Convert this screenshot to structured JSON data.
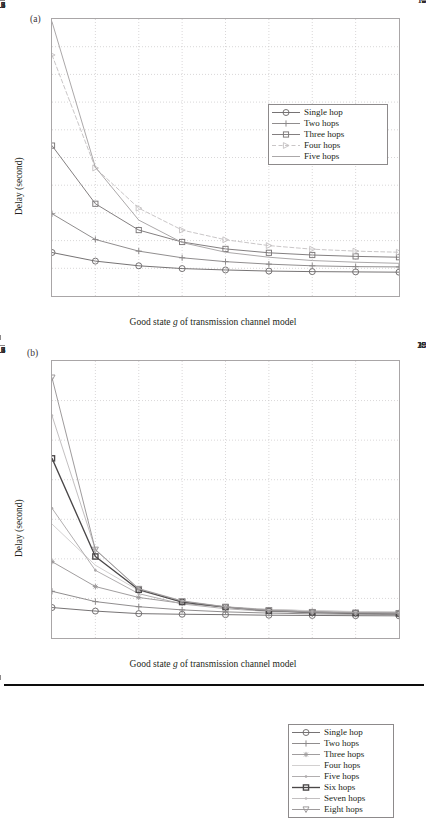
{
  "figure": {
    "panels": [
      {
        "id": "a",
        "label": "(a)",
        "xlabel_prefix": "Good state ",
        "xlabel_italic": "g",
        "xlabel_suffix": " of transmission channel model",
        "ylabel": "Delay (second)"
      },
      {
        "id": "b",
        "label": "(b)",
        "xlabel_prefix": "Good state ",
        "xlabel_italic": "g",
        "xlabel_suffix": " of transmission channel model",
        "ylabel": "Delay (second)"
      }
    ]
  },
  "chart_data": [
    {
      "type": "line",
      "panel": "a",
      "title": "",
      "xlabel": "Good state g of transmission channel model",
      "ylabel": "Delay (second)",
      "x": [
        0.1,
        0.2,
        0.3,
        0.4,
        0.5,
        0.6,
        0.7,
        0.8,
        0.9
      ],
      "xlim": [
        0.1,
        0.9
      ],
      "ylim": [
        1,
        11
      ],
      "xticks": [
        "0.1",
        "0.2",
        "0.3",
        "0.4",
        "0.5",
        "0.6",
        "0.7",
        "0.8",
        "0.9"
      ],
      "yticks": [
        "1",
        "2",
        "3",
        "4",
        "5",
        "6",
        "7",
        "8",
        "9",
        "10",
        "11"
      ],
      "grid": true,
      "legend_position": "upper right",
      "series": [
        {
          "name": "Single hop",
          "marker": "circle",
          "linestyle": "solid",
          "color": "#6f6c6d",
          "values": [
            2.57,
            2.26,
            2.09,
            1.99,
            1.94,
            1.9,
            1.88,
            1.87,
            1.86
          ]
        },
        {
          "name": "Two hops",
          "marker": "plus",
          "linestyle": "solid",
          "color": "#8a8788",
          "values": [
            3.97,
            3.04,
            2.62,
            2.38,
            2.24,
            2.15,
            2.09,
            2.06,
            2.05
          ]
        },
        {
          "name": "Three hops",
          "marker": "square",
          "linestyle": "solid",
          "color": "#7c7879",
          "values": [
            6.43,
            4.33,
            3.38,
            2.95,
            2.7,
            2.56,
            2.48,
            2.43,
            2.4
          ]
        },
        {
          "name": "Four hops",
          "marker": "triangle-right",
          "linestyle": "dashed",
          "color": "#c6c3c4",
          "values": [
            9.7,
            5.62,
            4.17,
            3.38,
            3.03,
            2.82,
            2.69,
            2.62,
            2.58
          ]
        },
        {
          "name": "Five hops",
          "marker": "none",
          "linestyle": "solid",
          "color": "#a6a3a4",
          "values": [
            10.9,
            5.65,
            3.74,
            2.93,
            2.58,
            2.4,
            2.28,
            2.22,
            2.18
          ]
        }
      ]
    },
    {
      "type": "line",
      "panel": "b",
      "title": "",
      "xlabel": "Good state g of transmission channel model",
      "ylabel": "Delay (second)",
      "x": [
        0.1,
        0.2,
        0.3,
        0.4,
        0.5,
        0.6,
        0.7,
        0.8,
        0.9
      ],
      "xlim": [
        0.1,
        0.9
      ],
      "ylim": [
        0,
        35
      ],
      "xticks": [
        "0.1",
        "0.2",
        "0.3",
        "0.4",
        "0.5",
        "0.6",
        "0.7",
        "0.8",
        "0.9"
      ],
      "yticks": [
        "0",
        "5",
        "10",
        "15",
        "20",
        "25",
        "30",
        "35"
      ],
      "grid": true,
      "legend_position": "upper right",
      "series": [
        {
          "name": "Single hop",
          "marker": "circle",
          "linestyle": "solid",
          "color": "#6f6c6d",
          "values": [
            3.85,
            3.4,
            3.08,
            3.0,
            2.95,
            2.88,
            2.85,
            2.82,
            2.8
          ]
        },
        {
          "name": "Two hops",
          "marker": "plus",
          "linestyle": "solid",
          "color": "#8a8788",
          "values": [
            5.9,
            4.6,
            3.95,
            3.55,
            3.3,
            3.15,
            3.05,
            3.0,
            2.95
          ]
        },
        {
          "name": "Three hops",
          "marker": "asterisk",
          "linestyle": "solid",
          "color": "#9b9899",
          "values": [
            9.65,
            6.5,
            5.12,
            4.38,
            3.9,
            3.6,
            3.42,
            3.32,
            3.25
          ]
        },
        {
          "name": "Four hops",
          "marker": "none",
          "linestyle": "solid",
          "color": "#d0cdce",
          "values": [
            14.4,
            9.2,
            6.0,
            4.6,
            3.95,
            3.6,
            3.45,
            3.35,
            3.3
          ]
        },
        {
          "name": "Five hops",
          "marker": "dot",
          "linestyle": "solid",
          "color": "#adaaab",
          "values": [
            16.4,
            8.55,
            5.6,
            4.3,
            3.7,
            3.35,
            3.2,
            3.1,
            3.05
          ]
        },
        {
          "name": "Six hops",
          "marker": "square",
          "linestyle": "solid",
          "color": "#4a4748",
          "values": [
            22.7,
            10.3,
            6.1,
            4.55,
            3.9,
            3.45,
            3.25,
            3.15,
            3.1
          ]
        },
        {
          "name": "Seven hops",
          "marker": "dot",
          "linestyle": "solid",
          "color": "#bfbcbd",
          "values": [
            28.1,
            11.2,
            6.25,
            4.7,
            3.95,
            3.5,
            3.3,
            3.2,
            3.15
          ]
        },
        {
          "name": "Eight hops",
          "marker": "triangle-down",
          "linestyle": "solid",
          "color": "#999697",
          "values": [
            32.9,
            11.15,
            6.2,
            4.65,
            3.92,
            3.48,
            3.28,
            3.18,
            3.12
          ]
        }
      ]
    }
  ]
}
